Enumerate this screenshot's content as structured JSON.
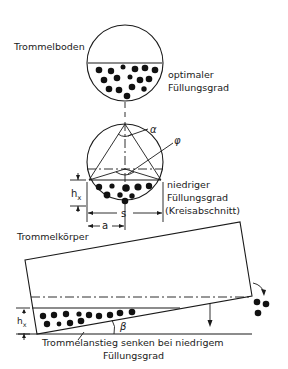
{
  "labels": {
    "trommelboden": "Trommelboden",
    "optimal_line1": "optimaler",
    "optimal_line2": "Füllungsgrad",
    "low_line1": "niedriger",
    "low_line2": "Füllungsgrad",
    "low_line3": "(Kreisabschnitt)",
    "trommelkoerper": "Trommelkörper",
    "caption_line1": "Trommelanstieg senken bei niedrigem",
    "caption_line2": "Füllungsgrad"
  },
  "symbols": {
    "alpha": "α",
    "phi": "φ",
    "hx_main": "h",
    "hx_sub": "x",
    "s": "s",
    "a": "a",
    "beta": "β"
  },
  "colors": {
    "ink": "#1a1a1a",
    "background": "#ffffff"
  }
}
